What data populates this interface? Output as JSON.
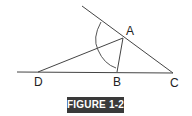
{
  "figure": {
    "caption": "FIGURE 1-2",
    "colors": {
      "line": "#444444",
      "caption_bg": "#3a3a3a",
      "caption_text": "#ffffff"
    },
    "points": {
      "A": {
        "label": "A",
        "x": 123,
        "y": 38
      },
      "B": {
        "label": "B",
        "x": 117,
        "y": 72
      },
      "C": {
        "label": "C",
        "x": 173,
        "y": 73
      },
      "D": {
        "label": "D",
        "x": 38,
        "y": 72
      }
    },
    "segments": [
      "ray through A to C",
      "horizontal line through D, B, C",
      "AD",
      "AB"
    ],
    "angle_arc": "arc at A between upper ray and AB"
  }
}
